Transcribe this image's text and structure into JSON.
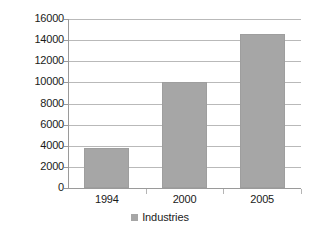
{
  "chart_data": {
    "type": "bar",
    "title": "",
    "subtitle": "",
    "xlabel": "",
    "ylabel": "",
    "categories": [
      "1994",
      "2000",
      "2005"
    ],
    "values": [
      3800,
      10000,
      14600
    ],
    "series": [
      {
        "name": "Industries",
        "values": [
          3800,
          10000,
          14600
        ],
        "color": "#a6a6a6"
      }
    ],
    "ylim": [
      0,
      16000
    ],
    "ytick_labels": [
      "0",
      "2000",
      "4000",
      "6000",
      "8000",
      "10000",
      "12000",
      "14000",
      "16000"
    ],
    "ytick_values": [
      0,
      2000,
      4000,
      6000,
      8000,
      10000,
      12000,
      14000,
      16000
    ],
    "grid": true,
    "grid_axis": "y",
    "legend": [
      {
        "label": "Industries",
        "color": "#a6a6a6"
      }
    ],
    "legend_position": "bottom",
    "annotations": []
  },
  "colors": {
    "bar_fill": "#a6a6a6",
    "bar_stroke": "#9e9e9e",
    "gridline": "#b9b9b9",
    "axis": "#9a9a9a",
    "text": "#1a1a1a",
    "background": "#ffffff"
  }
}
